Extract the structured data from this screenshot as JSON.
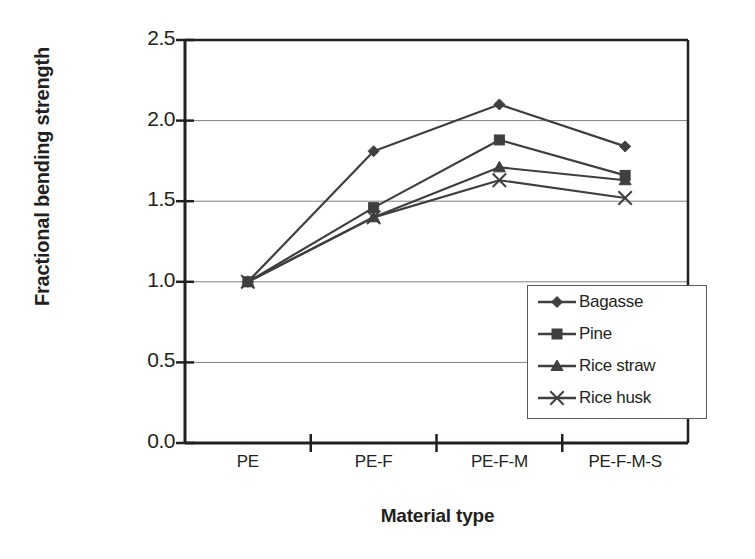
{
  "chart_data": {
    "type": "line",
    "title": "",
    "xlabel": "Material type",
    "ylabel": "Fractional bending strength",
    "categories": [
      "PE",
      "PE-F",
      "PE-F-M",
      "PE-F-M-S"
    ],
    "ylim": [
      0.0,
      2.5
    ],
    "yticks": [
      "0.0",
      "0.5",
      "1.0",
      "1.5",
      "2.0",
      "2.5"
    ],
    "ytick_values": [
      0.0,
      0.5,
      1.0,
      1.5,
      2.0,
      2.5
    ],
    "grid": true,
    "grid_axis": "y",
    "legend_position": "inside-bottom-right",
    "series": [
      {
        "name": "Bagasse",
        "marker": "diamond",
        "color": "#3f3f3f",
        "values": [
          1.0,
          1.81,
          2.1,
          1.84
        ]
      },
      {
        "name": "Pine",
        "marker": "square",
        "color": "#3f3f3f",
        "values": [
          1.0,
          1.46,
          1.88,
          1.66
        ]
      },
      {
        "name": "Rice straw",
        "marker": "triangle",
        "color": "#3f3f3f",
        "values": [
          1.0,
          1.4,
          1.71,
          1.63
        ]
      },
      {
        "name": "Rice husk",
        "marker": "cross",
        "color": "#3f3f3f",
        "values": [
          1.0,
          1.4,
          1.63,
          1.52
        ]
      }
    ]
  },
  "legend": {
    "items": [
      {
        "label": "Bagasse"
      },
      {
        "label": "Pine"
      },
      {
        "label": "Rice straw"
      },
      {
        "label": "Rice husk"
      }
    ]
  },
  "colors": {
    "axis": "#231f20",
    "grid": "#808080",
    "series": "#3f3f3f",
    "background": "#ffffff"
  }
}
